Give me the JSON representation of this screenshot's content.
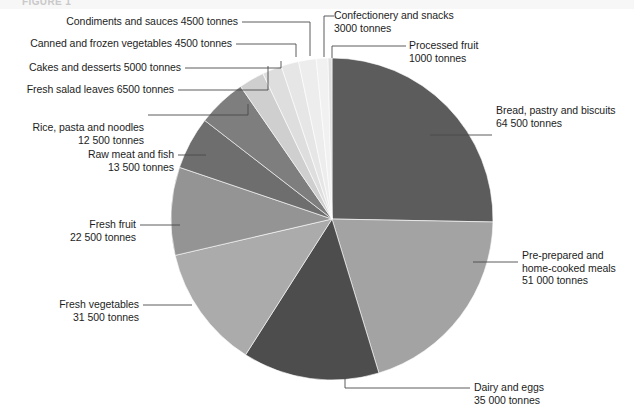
{
  "figure": {
    "title_clipped": "FIGURE 1",
    "units": "tonnes"
  },
  "chart_data": {
    "type": "pie",
    "title": "",
    "subtitle": "",
    "xlabel": "",
    "ylabel": "",
    "legend_position": "callout-labels",
    "grid": false,
    "units": "tonnes",
    "total": 254500,
    "start_angle_deg": 0,
    "direction": "clockwise",
    "categories": [
      "Bread, pastry and biscuits",
      "Pre-prepared and home-cooked meals",
      "Dairy and eggs",
      "Fresh vegetables",
      "Fresh fruit",
      "Raw meat and fish",
      "Rice, pasta and noodles",
      "Fresh salad leaves",
      "Cakes and desserts",
      "Canned and frozen vegetables",
      "Condiments and sauces",
      "Confectionery and snacks",
      "Processed fruit"
    ],
    "values": [
      64500,
      51000,
      35000,
      31500,
      22500,
      13500,
      12500,
      6500,
      5000,
      4500,
      4500,
      3000,
      1000
    ],
    "value_labels": [
      "64 500",
      "51 000",
      "35 000",
      "31 500",
      "22 500",
      "13 500",
      "12 500",
      "6500",
      "5000",
      "4500",
      "4500",
      "3000",
      "1000"
    ],
    "colors": [
      "#5c5c5c",
      "#a3a3a3",
      "#4d4d4d",
      "#ababab",
      "#949494",
      "#6e6e6e",
      "#7e7e7e",
      "#cfcfcf",
      "#dedede",
      "#e6e6e6",
      "#ededed",
      "#f1f1f1",
      "#e0e0e0"
    ]
  },
  "callouts": {
    "bread": {
      "line1": "Bread, pastry and biscuits",
      "line2": "64 500 tonnes"
    },
    "meals": {
      "line1": "Pre-prepared and",
      "line2": "home-cooked meals",
      "line3": "51 000 tonnes"
    },
    "dairy": {
      "line1": "Dairy and eggs",
      "line2": "35 000 tonnes"
    },
    "fresh_vegetables": {
      "line1": "Fresh vegetables",
      "line2": "31 500 tonnes"
    },
    "fresh_fruit": {
      "line1": "Fresh fruit",
      "line2": "22 500 tonnes"
    },
    "raw_meat": {
      "line1": "Raw meat and fish",
      "line2": "13 500 tonnes"
    },
    "rice": {
      "line1": "Rice, pasta and noodles",
      "line2": "12 500 tonnes"
    },
    "salad": {
      "line1": "Fresh salad leaves 6500 tonnes"
    },
    "cakes": {
      "line1": "Cakes and desserts 5000 tonnes"
    },
    "canned": {
      "line1": "Canned and frozen vegetables 4500 tonnes"
    },
    "condiments": {
      "line1": "Condiments and sauces 4500 tonnes"
    },
    "confectionery": {
      "line1": "Confectionery and snacks",
      "line2": "3000 tonnes"
    },
    "processed_fruit": {
      "line1": "Processed fruit",
      "line2": "1000 tonnes"
    }
  }
}
